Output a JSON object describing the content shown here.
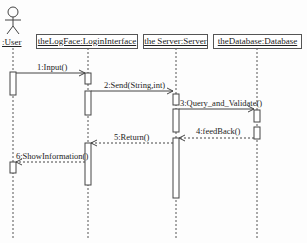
{
  "diagram": {
    "type": "uml-sequence",
    "actor": {
      "label": ":User"
    },
    "objects": [
      {
        "id": "login",
        "label": "theLogFace:LoginInterface"
      },
      {
        "id": "server",
        "label": "the Server:Server"
      },
      {
        "id": "db",
        "label": "theDatabase:Database"
      }
    ],
    "messages": [
      {
        "label": "1:Input()",
        "from": ":User",
        "to": "theLogFace:LoginInterface",
        "style": "solid"
      },
      {
        "label": "2:Send(String,int)",
        "from": "theLogFace:LoginInterface",
        "to": "the Server:Server",
        "style": "solid"
      },
      {
        "label": "3:Query_and_Validate()",
        "from": "the Server:Server",
        "to": "theDatabase:Database",
        "style": "solid"
      },
      {
        "label": "4:feedBack()",
        "from": "theDatabase:Database",
        "to": "the Server:Server",
        "style": "dashed"
      },
      {
        "label": "5:Return()",
        "from": "the Server:Server",
        "to": "theLogFace:LoginInterface",
        "style": "dashed"
      },
      {
        "label": "6:ShowInformation()",
        "from": "theLogFace:LoginInterface",
        "to": ":User",
        "style": "dashed"
      }
    ]
  }
}
